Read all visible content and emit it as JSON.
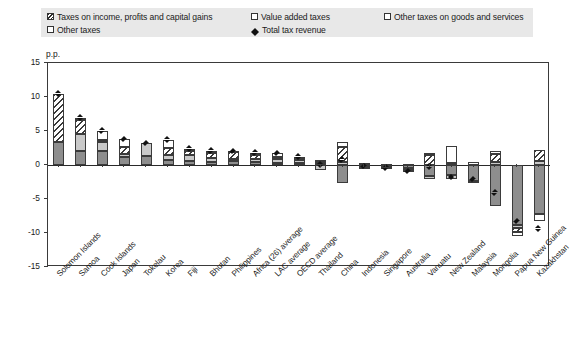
{
  "chart_data": {
    "type": "bar",
    "title": "",
    "subtitle": "",
    "xlabel": "",
    "ylabel": "p.p.",
    "unit_label": "p.p.",
    "ylim": [
      -15,
      15
    ],
    "yticks": [
      15,
      10,
      5,
      0,
      -5,
      -10,
      -15
    ],
    "ytick_labels": [
      "15",
      "10",
      "5",
      "0",
      "-5",
      "-10",
      "-15"
    ],
    "grid": false,
    "stacked": true,
    "legend_position": "top",
    "legend": [
      {
        "key": "income",
        "label": "Taxes on income, profits and capital gains",
        "swatch": "hatched-diagonal"
      },
      {
        "key": "vat",
        "label": "Value added taxes",
        "swatch": "mid-gray"
      },
      {
        "key": "othergs",
        "label": "Other taxes on goods and services",
        "swatch": "light-gray"
      },
      {
        "key": "other",
        "label": "Other taxes",
        "swatch": "white"
      },
      {
        "key": "total",
        "label": "Total tax revenue",
        "swatch": "black-diamond"
      }
    ],
    "categories": [
      "Solomon Islands",
      "Samoa",
      "Cook Islands",
      "Japan",
      "Tokelau",
      "Korea",
      "Fiji",
      "Bhutan",
      "Philippines",
      "Africa (26) average",
      "LAC average",
      "OECD average",
      "Thailand",
      "China",
      "Indonesia",
      "Singapore",
      "Australia",
      "Vanuatu",
      "New Zealand",
      "Malaysia",
      "Mongolia",
      "Papua New Guinea",
      "Kazakhstan"
    ],
    "series": [
      {
        "name": "Taxes on income, profits and capital gains",
        "key": "income",
        "values": [
          7.0,
          2.1,
          0.3,
          1.1,
          0.0,
          1.1,
          0.6,
          0.7,
          1.0,
          0.5,
          0.3,
          0.3,
          0.2,
          2.3,
          0.0,
          -0.2,
          -0.3,
          1.4,
          0.3,
          -0.2,
          1.1,
          -0.6,
          1.6
        ]
      },
      {
        "name": "Value added taxes",
        "key": "vat",
        "values": [
          3.4,
          2.1,
          2.0,
          1.2,
          1.3,
          0.8,
          0.6,
          0.5,
          0.6,
          0.4,
          0.3,
          0.3,
          0.2,
          -2.6,
          -0.3,
          -0.2,
          -0.5,
          -1.6,
          -1.5,
          -2.3,
          -6.1,
          -8.8,
          -7.2
        ]
      },
      {
        "name": "Other taxes on goods and services",
        "key": "othergs",
        "values": [
          0.0,
          2.4,
          1.4,
          0.4,
          1.9,
          0.6,
          0.9,
          0.6,
          0.3,
          0.5,
          0.6,
          0.4,
          -0.7,
          0.4,
          -0.2,
          -0.1,
          -0.2,
          -0.5,
          -0.6,
          -0.1,
          0.5,
          -0.4,
          0.6
        ]
      },
      {
        "name": "Other taxes",
        "key": "other",
        "values": [
          0.0,
          0.3,
          1.3,
          1.1,
          0.0,
          1.2,
          0.3,
          0.3,
          0.1,
          0.4,
          0.5,
          0.2,
          0.3,
          0.7,
          0.3,
          0.1,
          0.1,
          0.4,
          2.5,
          0.5,
          0.5,
          -0.6,
          -1.1
        ]
      }
    ],
    "total_tax_revenue": {
      "name": "Total tax revenue",
      "marker": "diamond",
      "values": [
        10.5,
        6.9,
        5.0,
        3.8,
        3.2,
        3.7,
        2.4,
        2.1,
        2.0,
        1.8,
        1.7,
        1.2,
        0.0,
        0.8,
        -0.2,
        -0.4,
        -0.9,
        -0.3,
        -1.8,
        -2.1,
        -4.1,
        -8.3,
        -9.4
      ]
    }
  }
}
